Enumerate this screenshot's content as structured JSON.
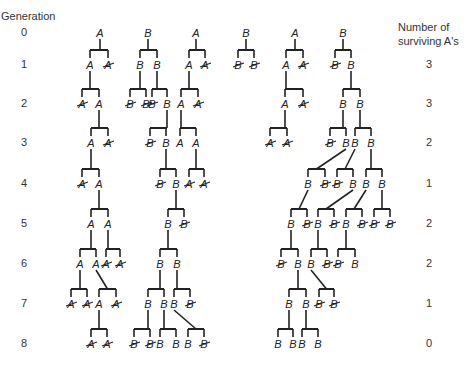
{
  "headers": {
    "generation": "Generation",
    "surviving_line1": "Number of",
    "surviving_line2": "surviving A's"
  },
  "generations": [
    {
      "gen": "0",
      "y": 33,
      "surviving": ""
    },
    {
      "gen": "1",
      "y": 65,
      "surviving": "3"
    },
    {
      "gen": "2",
      "y": 104,
      "surviving": "3"
    },
    {
      "gen": "3",
      "y": 143,
      "surviving": "2"
    },
    {
      "gen": "4",
      "y": 184,
      "surviving": "1"
    },
    {
      "gen": "5",
      "y": 224,
      "surviving": "2"
    },
    {
      "gen": "6",
      "y": 264,
      "surviving": "2"
    },
    {
      "gen": "7",
      "y": 304,
      "surviving": "1"
    },
    {
      "gen": "8",
      "y": 344,
      "surviving": "0"
    }
  ],
  "style": {
    "line_color": "#222222",
    "text_color": "#222222"
  },
  "nodes": [
    {
      "id": "a0",
      "l": "A",
      "x": 100,
      "g": 0
    },
    {
      "id": "b0",
      "l": "B",
      "x": 148,
      "g": 0
    },
    {
      "id": "c0",
      "l": "A",
      "x": 196,
      "g": 0
    },
    {
      "id": "d0",
      "l": "B",
      "x": 246,
      "g": 0
    },
    {
      "id": "e0",
      "l": "A",
      "x": 295,
      "g": 0
    },
    {
      "id": "f0",
      "l": "B",
      "x": 343,
      "g": 0
    },
    {
      "id": "a1",
      "l": "A",
      "x": 90,
      "g": 1,
      "p": "a0"
    },
    {
      "id": "a1x",
      "l": "A",
      "x": 108,
      "g": 1,
      "p": "a0",
      "dead": true
    },
    {
      "id": "b1",
      "l": "B",
      "x": 140,
      "g": 1,
      "p": "b0"
    },
    {
      "id": "b1b",
      "l": "B",
      "x": 157,
      "g": 1,
      "p": "b0"
    },
    {
      "id": "c1",
      "l": "A",
      "x": 189,
      "g": 1,
      "p": "c0"
    },
    {
      "id": "c1x",
      "l": "A",
      "x": 205,
      "g": 1,
      "p": "c0",
      "dead": true
    },
    {
      "id": "d1x",
      "l": "B",
      "x": 238,
      "g": 1,
      "p": "d0",
      "dead": true
    },
    {
      "id": "d1y",
      "l": "B",
      "x": 254,
      "g": 1,
      "p": "d0",
      "dead": true
    },
    {
      "id": "e1",
      "l": "A",
      "x": 286,
      "g": 1,
      "p": "e0"
    },
    {
      "id": "e1x",
      "l": "A",
      "x": 303,
      "g": 1,
      "p": "e0",
      "dead": true
    },
    {
      "id": "f1x",
      "l": "B",
      "x": 335,
      "g": 1,
      "p": "f0",
      "dead": true
    },
    {
      "id": "f1",
      "l": "B",
      "x": 351,
      "g": 1,
      "p": "f0"
    },
    {
      "id": "a2x",
      "l": "A",
      "x": 82,
      "g": 2,
      "p": "a1",
      "dead": true
    },
    {
      "id": "a2",
      "l": "A",
      "x": 99,
      "g": 2,
      "p": "a1"
    },
    {
      "id": "b2x",
      "l": "B",
      "x": 130,
      "g": 2,
      "p": "b1",
      "dead": true
    },
    {
      "id": "b2y",
      "l": "B",
      "x": 146,
      "g": 2,
      "p": "b1",
      "dead": true
    },
    {
      "id": "b2z",
      "l": "B",
      "x": 152,
      "g": 2,
      "p": "b1b",
      "dead": true
    },
    {
      "id": "b2",
      "l": "B",
      "x": 167,
      "g": 2,
      "p": "b1b"
    },
    {
      "id": "c2",
      "l": "A",
      "x": 181,
      "g": 2,
      "p": "c1"
    },
    {
      "id": "c2x",
      "l": "A",
      "x": 198,
      "g": 2,
      "p": "c1",
      "dead": true
    },
    {
      "id": "e2",
      "l": "A",
      "x": 285,
      "g": 2,
      "p": "e1"
    },
    {
      "id": "e2x",
      "l": "A",
      "x": 303,
      "g": 2,
      "p": "e1",
      "dead": true
    },
    {
      "id": "f2a",
      "l": "B",
      "x": 343,
      "g": 2,
      "p": "f1"
    },
    {
      "id": "f2b",
      "l": "B",
      "x": 360,
      "g": 2,
      "p": "f1"
    },
    {
      "id": "a3",
      "l": "A",
      "x": 91,
      "g": 3,
      "p": "a2"
    },
    {
      "id": "a3x",
      "l": "A",
      "x": 108,
      "g": 3,
      "p": "a2",
      "dead": true
    },
    {
      "id": "b3x",
      "l": "B",
      "x": 150,
      "g": 3,
      "p": "b2",
      "dead": true
    },
    {
      "id": "b3",
      "l": "B",
      "x": 166,
      "g": 3,
      "p": "b2"
    },
    {
      "id": "c3a",
      "l": "A",
      "x": 180,
      "g": 3,
      "p": "c2"
    },
    {
      "id": "c3b",
      "l": "A",
      "x": 196,
      "g": 3,
      "p": "c2"
    },
    {
      "id": "e3x",
      "l": "A",
      "x": 270,
      "g": 3,
      "p": "e2",
      "dead": true
    },
    {
      "id": "e3y",
      "l": "A",
      "x": 287,
      "g": 3,
      "p": "e2",
      "dead": true
    },
    {
      "id": "f3x",
      "l": "B",
      "x": 330,
      "g": 3,
      "p": "f2a",
      "dead": true
    },
    {
      "id": "f3a",
      "l": "B",
      "x": 346,
      "g": 3,
      "p": "f2a"
    },
    {
      "id": "f3b",
      "l": "B",
      "x": 355,
      "g": 3,
      "p": "f2b"
    },
    {
      "id": "f3c",
      "l": "B",
      "x": 371,
      "g": 3,
      "p": "f2b"
    },
    {
      "id": "a4x",
      "l": "A",
      "x": 82,
      "g": 4,
      "p": "a3",
      "dead": true
    },
    {
      "id": "a4",
      "l": "A",
      "x": 99,
      "g": 4,
      "p": "a3"
    },
    {
      "id": "b4x",
      "l": "B",
      "x": 160,
      "g": 4,
      "p": "b3",
      "dead": true
    },
    {
      "id": "b4",
      "l": "B",
      "x": 176,
      "g": 4,
      "p": "b3"
    },
    {
      "id": "c4x",
      "l": "A",
      "x": 189,
      "g": 4,
      "p": "c3b",
      "dead": true
    },
    {
      "id": "c4y",
      "l": "A",
      "x": 204,
      "g": 4,
      "p": "c3b",
      "dead": true
    },
    {
      "id": "f4a",
      "l": "B",
      "x": 308,
      "g": 4,
      "p": "f3a",
      "slant": true
    },
    {
      "id": "f4x",
      "l": "B",
      "x": 325,
      "g": 4,
      "p": "f3a",
      "dead": true,
      "slant": true
    },
    {
      "id": "f4y",
      "l": "B",
      "x": 337,
      "g": 4,
      "p": "f3b",
      "dead": true,
      "slant": true
    },
    {
      "id": "f4b",
      "l": "B",
      "x": 353,
      "g": 4,
      "p": "f3b",
      "slant": true
    },
    {
      "id": "f4c",
      "l": "B",
      "x": 366,
      "g": 4,
      "p": "f3c"
    },
    {
      "id": "f4d",
      "l": "B",
      "x": 382,
      "g": 4,
      "p": "f3c"
    },
    {
      "id": "a5a",
      "l": "A",
      "x": 91,
      "g": 5,
      "p": "a4"
    },
    {
      "id": "a5b",
      "l": "A",
      "x": 108,
      "g": 5,
      "p": "a4"
    },
    {
      "id": "b5",
      "l": "B",
      "x": 168,
      "g": 5,
      "p": "b4"
    },
    {
      "id": "b5x",
      "l": "B",
      "x": 184,
      "g": 5,
      "p": "b4",
      "dead": true
    },
    {
      "id": "f5a",
      "l": "B",
      "x": 291,
      "g": 5,
      "p": "f4a",
      "slant": true
    },
    {
      "id": "f5x",
      "l": "B",
      "x": 307,
      "g": 5,
      "p": "f4a",
      "dead": true,
      "slant": true
    },
    {
      "id": "f5b",
      "l": "B",
      "x": 318,
      "g": 5,
      "p": "f4b",
      "slant": true
    },
    {
      "id": "f5y",
      "l": "B",
      "x": 334,
      "g": 5,
      "p": "f4b",
      "dead": true,
      "slant": true
    },
    {
      "id": "f5c",
      "l": "B",
      "x": 346,
      "g": 5,
      "p": "f4c",
      "slant": true
    },
    {
      "id": "f5z",
      "l": "B",
      "x": 362,
      "g": 5,
      "p": "f4c",
      "dead": true,
      "slant": true
    },
    {
      "id": "f5w",
      "l": "B",
      "x": 374,
      "g": 5,
      "p": "f4d",
      "dead": true
    },
    {
      "id": "f5v",
      "l": "B",
      "x": 390,
      "g": 5,
      "p": "f4d",
      "dead": true
    },
    {
      "id": "a6a",
      "l": "A",
      "x": 80,
      "g": 6,
      "p": "a5a"
    },
    {
      "id": "a6b",
      "l": "A",
      "x": 96,
      "g": 6,
      "p": "a5a"
    },
    {
      "id": "a6x",
      "l": "A",
      "x": 106,
      "g": 6,
      "p": "a5b",
      "dead": true
    },
    {
      "id": "a6y",
      "l": "A",
      "x": 120,
      "g": 6,
      "p": "a5b",
      "dead": true
    },
    {
      "id": "b6a",
      "l": "B",
      "x": 160,
      "g": 6,
      "p": "b5"
    },
    {
      "id": "b6b",
      "l": "B",
      "x": 177,
      "g": 6,
      "p": "b5"
    },
    {
      "id": "f6x",
      "l": "B",
      "x": 281,
      "g": 6,
      "p": "f5a",
      "dead": true
    },
    {
      "id": "f6a",
      "l": "B",
      "x": 298,
      "g": 6,
      "p": "f5a"
    },
    {
      "id": "f6b",
      "l": "B",
      "x": 311,
      "g": 6,
      "p": "f5b"
    },
    {
      "id": "f6y",
      "l": "B",
      "x": 327,
      "g": 6,
      "p": "f5b",
      "dead": true
    },
    {
      "id": "f6z",
      "l": "B",
      "x": 338,
      "g": 6,
      "p": "f5c",
      "dead": true
    },
    {
      "id": "f6c",
      "l": "B",
      "x": 355,
      "g": 6,
      "p": "f5c"
    },
    {
      "id": "a7x",
      "l": "A",
      "x": 71,
      "g": 7,
      "p": "a6a",
      "dead": true
    },
    {
      "id": "a7y",
      "l": "A",
      "x": 87,
      "g": 7,
      "p": "a6a",
      "dead": true
    },
    {
      "id": "a7",
      "l": "A",
      "x": 99,
      "g": 7,
      "p": "a6b",
      "slant": true
    },
    {
      "id": "a7z",
      "l": "A",
      "x": 116,
      "g": 7,
      "p": "a6b",
      "dead": true,
      "slant": true
    },
    {
      "id": "b7a",
      "l": "B",
      "x": 148,
      "g": 7,
      "p": "b6a"
    },
    {
      "id": "b7b",
      "l": "B",
      "x": 164,
      "g": 7,
      "p": "b6a"
    },
    {
      "id": "b7c",
      "l": "B",
      "x": 174,
      "g": 7,
      "p": "b6b"
    },
    {
      "id": "b7x",
      "l": "B",
      "x": 190,
      "g": 7,
      "p": "b6b",
      "dead": true
    },
    {
      "id": "f7a",
      "l": "B",
      "x": 289,
      "g": 7,
      "p": "f6a"
    },
    {
      "id": "f7b",
      "l": "B",
      "x": 306,
      "g": 7,
      "p": "f6a"
    },
    {
      "id": "f7x",
      "l": "B",
      "x": 319,
      "g": 7,
      "p": "f6b",
      "dead": true,
      "slant": true
    },
    {
      "id": "f7y",
      "l": "B",
      "x": 334,
      "g": 7,
      "p": "f6b",
      "dead": true,
      "slant": true
    },
    {
      "id": "a8x",
      "l": "A",
      "x": 91,
      "g": 8,
      "p": "a7",
      "dead": true
    },
    {
      "id": "a8y",
      "l": "A",
      "x": 107,
      "g": 8,
      "p": "a7",
      "dead": true
    },
    {
      "id": "b8x",
      "l": "B",
      "x": 134,
      "g": 8,
      "p": "b7a",
      "dead": true
    },
    {
      "id": "b8y",
      "l": "B",
      "x": 150,
      "g": 8,
      "p": "b7a",
      "dead": true
    },
    {
      "id": "b8a",
      "l": "B",
      "x": 160,
      "g": 8,
      "p": "b7b"
    },
    {
      "id": "b8b",
      "l": "B",
      "x": 176,
      "g": 8,
      "p": "b7b"
    },
    {
      "id": "b8c",
      "l": "B",
      "x": 188,
      "g": 8,
      "p": "b7c",
      "slant": true
    },
    {
      "id": "b8z",
      "l": "B",
      "x": 204,
      "g": 8,
      "p": "b7c",
      "dead": true,
      "slant": true
    },
    {
      "id": "f8a",
      "l": "B",
      "x": 278,
      "g": 8,
      "p": "f7a"
    },
    {
      "id": "f8b",
      "l": "B",
      "x": 293,
      "g": 8,
      "p": "f7a"
    },
    {
      "id": "f8c",
      "l": "B",
      "x": 302,
      "g": 8,
      "p": "f7b"
    },
    {
      "id": "f8d",
      "l": "B",
      "x": 318,
      "g": 8,
      "p": "f7b"
    }
  ]
}
